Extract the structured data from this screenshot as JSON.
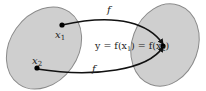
{
  "diagram": {
    "type": "function-mapping",
    "colors": {
      "set_fill": "#cfcfcf",
      "set_stroke": "#8a8a8a",
      "arrow": "#111111",
      "point": "#000000"
    },
    "domain_points": [
      {
        "label": "x",
        "subscript": "1"
      },
      {
        "label": "x",
        "subscript": "2"
      }
    ],
    "arrow_labels": [
      "f",
      "f"
    ],
    "equation": {
      "prefix": "y = f(x",
      "sub1": "1",
      "mid": ") = f(x",
      "sub2": "2",
      "suffix": ")"
    }
  }
}
